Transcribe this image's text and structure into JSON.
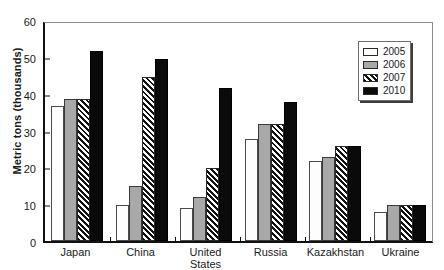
{
  "chart_data": {
    "type": "bar",
    "title": "",
    "xlabel": "",
    "ylabel": "Metric tons (thousands)",
    "ylim": [
      0,
      60
    ],
    "ytick_values": [
      0,
      10,
      20,
      30,
      40,
      50,
      60
    ],
    "ytick_labels": [
      "0",
      "10",
      "20",
      "30",
      "40",
      "50",
      "60"
    ],
    "grid": false,
    "legend_position": "top-right",
    "categories": [
      "Japan",
      "China",
      "United States",
      "Russia",
      "Kazakhstan",
      "Ukraine"
    ],
    "series": [
      {
        "name": "2005",
        "values": [
          37,
          10,
          9,
          28,
          22,
          8
        ],
        "color": "#fdfdfd",
        "fill": "white"
      },
      {
        "name": "2006",
        "values": [
          39,
          15,
          12,
          32,
          23,
          10
        ],
        "color": "#a8a8a8",
        "fill": "gray"
      },
      {
        "name": "2007",
        "values": [
          39,
          45,
          20,
          32,
          26,
          10
        ],
        "color": "#ffffff",
        "fill": "hatched"
      },
      {
        "name": "2010",
        "values": [
          52,
          50,
          42,
          38,
          26,
          10
        ],
        "color": "#0a0a0a",
        "fill": "black"
      }
    ]
  }
}
